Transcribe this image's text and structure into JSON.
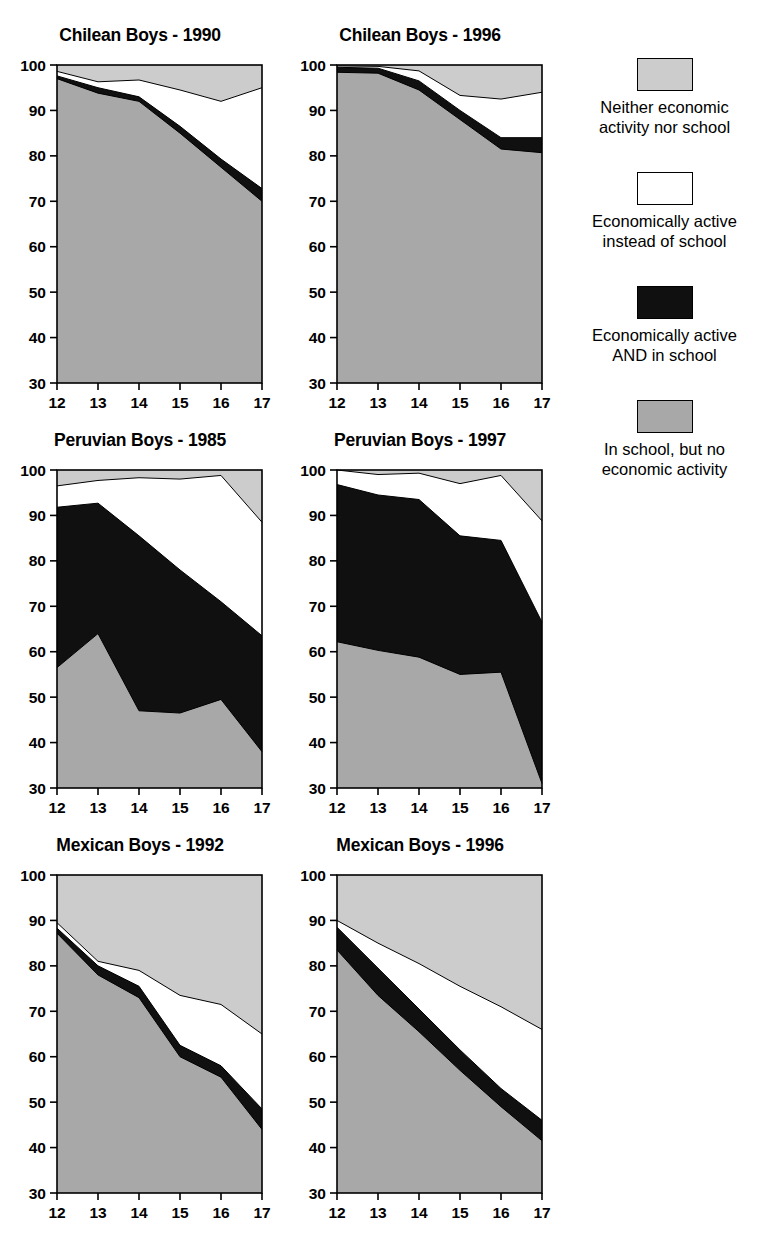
{
  "figure": {
    "kind": "stacked-area-panel-grid",
    "panel_count": 6,
    "x_label_values": [
      "12",
      "13",
      "14",
      "15",
      "16",
      "17"
    ],
    "y_label_values": [
      "30",
      "40",
      "50",
      "60",
      "70",
      "80",
      "90",
      "100"
    ]
  },
  "legend": {
    "items": [
      {
        "swatch": "light-gray",
        "color": "#cccccc",
        "label": "Neither economic\nactivity nor school"
      },
      {
        "swatch": "white",
        "color": "#ffffff",
        "label": "Economically active\ninstead of school"
      },
      {
        "swatch": "black",
        "color": "#101010",
        "label": "Economically active\nAND in school"
      },
      {
        "swatch": "gray",
        "color": "#a8a8a8",
        "label": "In school, but no\neconomic activity"
      }
    ]
  },
  "panels": [
    {
      "id": "chilean-1990",
      "title": "Chilean Boys - 1990"
    },
    {
      "id": "chilean-1996",
      "title": "Chilean Boys - 1996"
    },
    {
      "id": "peruvian-1985",
      "title": "Peruvian Boys - 1985"
    },
    {
      "id": "peruvian-1997",
      "title": "Peruvian Boys - 1997"
    },
    {
      "id": "mexican-1992",
      "title": "Mexican Boys - 1992"
    },
    {
      "id": "mexican-1996",
      "title": "Mexican Boys - 1996"
    }
  ],
  "chart_data": [
    {
      "type": "area",
      "title": "Chilean Boys - 1990",
      "xlabel": "",
      "ylabel": "",
      "x": [
        12,
        13,
        14,
        15,
        16,
        17
      ],
      "xlim": [
        12,
        17
      ],
      "ylim": [
        30,
        100
      ],
      "yticks": [
        30,
        40,
        50,
        60,
        70,
        80,
        90,
        100
      ],
      "grid": false,
      "stacking": "cumulative-from-bottom",
      "series": [
        {
          "name": "In school, but no economic activity",
          "color": "#a8a8a8",
          "values": [
            97.0,
            93.8,
            92.0,
            85.0,
            77.5,
            70.0
          ]
        },
        {
          "name": "Economically active AND in school",
          "color": "#101010",
          "values": [
            97.6,
            95.0,
            93.0,
            86.5,
            79.3,
            72.8
          ]
        },
        {
          "name": "Economically active instead of school",
          "color": "#ffffff",
          "values": [
            98.6,
            96.3,
            96.7,
            94.5,
            92.0,
            95.0
          ]
        },
        {
          "name": "Neither economic activity nor school",
          "color": "#cccccc",
          "values": [
            100,
            100,
            100,
            100,
            100,
            100
          ]
        }
      ]
    },
    {
      "type": "area",
      "title": "Chilean Boys - 1996",
      "xlabel": "",
      "ylabel": "",
      "x": [
        12,
        13,
        14,
        15,
        16,
        17
      ],
      "xlim": [
        12,
        17
      ],
      "ylim": [
        30,
        100
      ],
      "yticks": [
        30,
        40,
        50,
        60,
        70,
        80,
        90,
        100
      ],
      "grid": false,
      "stacking": "cumulative-from-bottom",
      "series": [
        {
          "name": "In school, but no economic activity",
          "color": "#a8a8a8",
          "values": [
            98.4,
            98.2,
            94.5,
            88.0,
            81.5,
            80.7
          ]
        },
        {
          "name": "Economically active AND in school",
          "color": "#101010",
          "values": [
            99.5,
            99.3,
            96.5,
            90.0,
            84.0,
            84.0
          ]
        },
        {
          "name": "Economically active instead of school",
          "color": "#ffffff",
          "values": [
            99.8,
            99.7,
            98.7,
            93.3,
            92.5,
            94.0
          ]
        },
        {
          "name": "Neither economic activity nor school",
          "color": "#cccccc",
          "values": [
            100,
            100,
            100,
            100,
            100,
            100
          ]
        }
      ]
    },
    {
      "type": "area",
      "title": "Peruvian Boys - 1985",
      "xlabel": "",
      "ylabel": "",
      "x": [
        12,
        13,
        14,
        15,
        16,
        17
      ],
      "xlim": [
        12,
        17
      ],
      "ylim": [
        30,
        100
      ],
      "yticks": [
        30,
        40,
        50,
        60,
        70,
        80,
        90,
        100
      ],
      "grid": false,
      "stacking": "cumulative-from-bottom",
      "series": [
        {
          "name": "In school, but no economic activity",
          "color": "#a8a8a8",
          "values": [
            56.5,
            64.0,
            47.0,
            46.5,
            49.5,
            38.0
          ]
        },
        {
          "name": "Economically active AND in school",
          "color": "#101010",
          "values": [
            91.8,
            92.7,
            85.5,
            78.0,
            71.0,
            63.5
          ]
        },
        {
          "name": "Economically active instead of school",
          "color": "#ffffff",
          "values": [
            96.5,
            97.7,
            98.3,
            98.0,
            98.8,
            88.5
          ]
        },
        {
          "name": "Neither economic activity nor school",
          "color": "#cccccc",
          "values": [
            100,
            100,
            100,
            100,
            100,
            100
          ]
        }
      ]
    },
    {
      "type": "area",
      "title": "Peruvian Boys - 1997",
      "xlabel": "",
      "ylabel": "",
      "x": [
        12,
        13,
        14,
        15,
        16,
        17
      ],
      "xlim": [
        12,
        17
      ],
      "ylim": [
        30,
        100
      ],
      "yticks": [
        30,
        40,
        50,
        60,
        70,
        80,
        90,
        100
      ],
      "grid": false,
      "stacking": "cumulative-from-bottom",
      "series": [
        {
          "name": "In school, but no economic activity",
          "color": "#a8a8a8",
          "values": [
            62.2,
            60.3,
            58.8,
            55.0,
            55.5,
            31.0
          ]
        },
        {
          "name": "Economically active AND in school",
          "color": "#101010",
          "values": [
            96.8,
            94.5,
            93.5,
            85.5,
            84.5,
            66.5
          ]
        },
        {
          "name": "Economically active instead of school",
          "color": "#ffffff",
          "values": [
            100.0,
            99.0,
            99.3,
            97.0,
            98.8,
            88.8
          ]
        },
        {
          "name": "Neither economic activity nor school",
          "color": "#cccccc",
          "values": [
            100,
            100,
            100,
            100,
            100,
            100
          ]
        }
      ]
    },
    {
      "type": "area",
      "title": "Mexican Boys - 1992",
      "xlabel": "",
      "ylabel": "",
      "x": [
        12,
        13,
        14,
        15,
        16,
        17
      ],
      "xlim": [
        12,
        17
      ],
      "ylim": [
        30,
        100
      ],
      "yticks": [
        30,
        40,
        50,
        60,
        70,
        80,
        90,
        100
      ],
      "grid": false,
      "stacking": "cumulative-from-bottom",
      "series": [
        {
          "name": "In school, but no economic activity",
          "color": "#a8a8a8",
          "values": [
            87.2,
            78.0,
            73.0,
            60.0,
            55.5,
            44.0
          ]
        },
        {
          "name": "Economically active AND in school",
          "color": "#101010",
          "values": [
            88.3,
            80.0,
            75.5,
            62.5,
            58.0,
            48.5
          ]
        },
        {
          "name": "Economically active instead of school",
          "color": "#ffffff",
          "values": [
            89.5,
            81.0,
            79.0,
            73.5,
            71.5,
            65.0
          ]
        },
        {
          "name": "Neither economic activity nor school",
          "color": "#cccccc",
          "values": [
            100,
            100,
            100,
            100,
            100,
            100
          ]
        }
      ]
    },
    {
      "type": "area",
      "title": "Mexican Boys - 1996",
      "xlabel": "",
      "ylabel": "",
      "x": [
        12,
        13,
        14,
        15,
        16,
        17
      ],
      "xlim": [
        12,
        17
      ],
      "ylim": [
        30,
        100
      ],
      "yticks": [
        30,
        40,
        50,
        60,
        70,
        80,
        90,
        100
      ],
      "grid": false,
      "stacking": "cumulative-from-bottom",
      "series": [
        {
          "name": "In school, but no economic activity",
          "color": "#a8a8a8",
          "values": [
            83.5,
            73.5,
            65.5,
            57.0,
            49.0,
            41.5
          ]
        },
        {
          "name": "Economically active AND in school",
          "color": "#101010",
          "values": [
            88.5,
            79.5,
            70.5,
            61.5,
            53.0,
            46.0
          ]
        },
        {
          "name": "Economically active instead of school",
          "color": "#ffffff",
          "values": [
            90.0,
            85.0,
            80.5,
            75.5,
            71.0,
            66.0
          ]
        },
        {
          "name": "Neither economic activity nor school",
          "color": "#cccccc",
          "values": [
            100,
            100,
            100,
            100,
            100,
            100
          ]
        }
      ]
    }
  ]
}
